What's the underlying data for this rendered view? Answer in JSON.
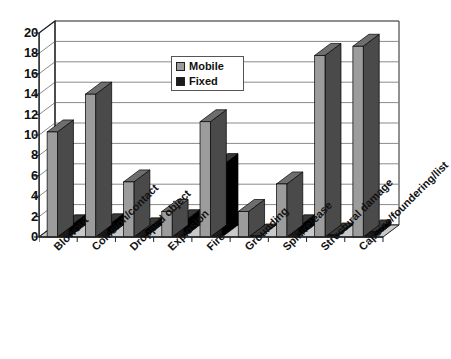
{
  "chart_data": {
    "type": "bar",
    "title": "",
    "subtitle": "",
    "xlabel": "",
    "ylabel": "",
    "ylim": [
      0,
      20
    ],
    "ytick_step": 2,
    "yticks": [
      20,
      18,
      16,
      14,
      12,
      10,
      8,
      6,
      4,
      2,
      0
    ],
    "grid": true,
    "grid_axis": "y",
    "style": "3d-column",
    "legend_position": "upper-center",
    "categories": [
      "Blowout",
      "Collision/contact",
      "Dropped object",
      "Explosion",
      "Fire",
      "Grounding",
      "Spill/release",
      "Structural damage",
      "Capsize/foundering/list"
    ],
    "series": [
      {
        "name": "Mobile",
        "color": "#9c9c9c",
        "values": [
          10.3,
          14.0,
          5.4,
          2.5,
          11.3,
          2.5,
          5.2,
          17.8,
          18.7
        ]
      },
      {
        "name": "Fixed",
        "color": "#1b1b1b",
        "values": [
          1.0,
          1.1,
          0.7,
          1.5,
          7.0,
          0.1,
          1.0,
          0.2,
          0.5
        ]
      }
    ]
  },
  "legend": {
    "entries": [
      {
        "label": "Mobile",
        "swatch": "#9c9c9c"
      },
      {
        "label": "Fixed",
        "swatch": "#1b1b1b"
      }
    ]
  },
  "axis": {
    "y_tick_labels": [
      "20",
      "18",
      "16",
      "14",
      "12",
      "10",
      "8",
      "6",
      "4",
      "2",
      "0"
    ]
  },
  "colors": {
    "mobile": "#9c9c9c",
    "mobile_side": "#4a4a4a",
    "mobile_top": "#6e6e6e",
    "fixed": "#1b1b1b",
    "fixed_side": "#000000",
    "fixed_top": "#3a3a3a",
    "grid": "#8a8a8a",
    "frame": "#222222",
    "floor": "#c9c9c9",
    "text": "#111111"
  }
}
